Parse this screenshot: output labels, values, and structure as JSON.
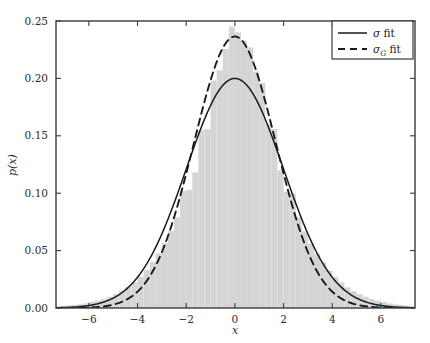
{
  "chart_data": {
    "type": "histogram",
    "title": "",
    "xlabel": "x",
    "ylabel": "p(x)",
    "xlim": [
      -7.35,
      7.4
    ],
    "ylim": [
      0.0,
      0.25
    ],
    "grid": false,
    "xticks": [
      -6,
      -4,
      -2,
      0,
      2,
      4,
      6
    ],
    "xtick_labels": [
      "−6",
      "−4",
      "−2",
      "0",
      "2",
      "4",
      "6"
    ],
    "yticks": [
      0.0,
      0.05,
      0.1,
      0.15,
      0.2,
      0.25
    ],
    "ytick_labels": [
      "0.00",
      "0.05",
      "0.10",
      "0.15",
      "0.20",
      "0.25"
    ],
    "legend": {
      "position": "upper right",
      "entries": [
        {
          "label": "σ fit",
          "style": "solid",
          "color": "#1a1a1a"
        },
        {
          "label": "σ_G fit",
          "style": "dashed",
          "color": "#1a1a1a"
        }
      ]
    },
    "histogram": {
      "name": "sample distribution",
      "fill_color": "#d5d5d5",
      "edge_color": "#d5d5d5",
      "bin_width": 0.25,
      "bin_centers": [
        -7.375,
        -7.125,
        -6.875,
        -6.625,
        -6.375,
        -6.125,
        -5.875,
        -5.625,
        -5.375,
        -5.125,
        -4.875,
        -4.625,
        -4.375,
        -4.125,
        -3.875,
        -3.625,
        -3.375,
        -3.125,
        -2.875,
        -2.625,
        -2.375,
        -2.125,
        -1.875,
        -1.625,
        -1.375,
        -1.125,
        -0.875,
        -0.625,
        -0.375,
        -0.125,
        0.125,
        0.375,
        0.625,
        0.875,
        1.125,
        1.375,
        1.625,
        1.875,
        2.125,
        2.375,
        2.625,
        2.875,
        3.125,
        3.375,
        3.625,
        3.875,
        4.125,
        4.375,
        4.625,
        4.875,
        5.125,
        5.375,
        5.625,
        5.875,
        6.125,
        6.375,
        6.625,
        6.875,
        7.125,
        7.375
      ],
      "densities": [
        0.0015,
        0.0017,
        0.0022,
        0.0026,
        0.0032,
        0.004,
        0.0054,
        0.0065,
        0.008,
        0.0098,
        0.0123,
        0.015,
        0.0183,
        0.0225,
        0.0272,
        0.033,
        0.0402,
        0.0475,
        0.0567,
        0.067,
        0.079,
        0.102,
        0.103,
        0.118,
        0.155,
        0.156,
        0.198,
        0.207,
        0.2255,
        0.245,
        0.24,
        0.233,
        0.227,
        0.206,
        0.196,
        0.16,
        0.156,
        0.12,
        0.101,
        0.1,
        0.079,
        0.0668,
        0.0563,
        0.0474,
        0.04,
        0.0327,
        0.027,
        0.0222,
        0.018,
        0.0147,
        0.0121,
        0.0097,
        0.0078,
        0.0064,
        0.0052,
        0.0039,
        0.0031,
        0.0025,
        0.0021,
        0.0016
      ]
    },
    "curves": [
      {
        "name": "sigma fit",
        "label": "σ fit",
        "style": "solid",
        "color": "#1a1a1a",
        "type": "gaussian",
        "mu": 0.0,
        "sigma": 1.995,
        "peak": 0.2
      },
      {
        "name": "sigma_G fit",
        "label": "σ_G fit",
        "style": "dashed",
        "color": "#1a1a1a",
        "type": "gaussian",
        "mu": 0.0,
        "sigma": 1.687,
        "peak": 0.2365
      }
    ]
  }
}
